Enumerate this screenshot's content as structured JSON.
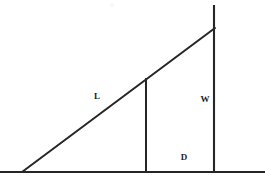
{
  "figure": {
    "background_color": "#ffffff",
    "stroke_color": "#262626",
    "label_color": "#1c1c1c",
    "canvas": {
      "width": 271,
      "height": 183
    },
    "labels": [
      {
        "id": "hypotenuse-label",
        "text": "L",
        "x": 97,
        "y": 96
      },
      {
        "id": "right-side-label",
        "text": "W",
        "x": 205,
        "y": 99
      },
      {
        "id": "base-segment-label",
        "text": "D",
        "x": 184,
        "y": 157
      }
    ],
    "lines": [
      {
        "id": "baseline",
        "name": "ground-line",
        "x1": 0,
        "y1": 172,
        "x2": 265,
        "y2": 172,
        "stroke_width": 2.1
      },
      {
        "id": "hypotenuse",
        "name": "ramp-line-L",
        "x1": 22,
        "y1": 172,
        "x2": 215,
        "y2": 28,
        "stroke_width": 2.0
      },
      {
        "id": "right-vertical",
        "name": "vertical-line-W",
        "x1": 214,
        "y1": 5,
        "x2": 214,
        "y2": 172,
        "stroke_width": 2.1
      },
      {
        "id": "inner-vertical",
        "name": "vertical-line-D-boundary",
        "x1": 146,
        "y1": 78,
        "x2": 146,
        "y2": 172,
        "stroke_width": 2.0
      }
    ],
    "artifacts": [
      {
        "id": "scan-speck",
        "x": 110,
        "y": 3
      }
    ]
  }
}
